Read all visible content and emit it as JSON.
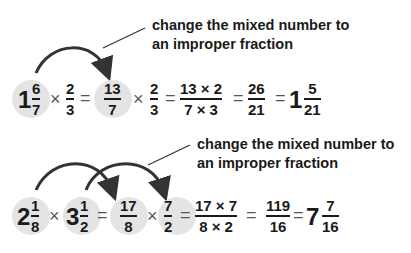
{
  "example1": {
    "note_line1": "change the mixed number to",
    "note_line2": "an improper fraction",
    "mixed": {
      "whole": "1",
      "num": "6",
      "den": "7"
    },
    "times": "×",
    "eq": "=",
    "f2": {
      "num": "2",
      "den": "3"
    },
    "improper": {
      "num": "13",
      "den": "7"
    },
    "f2b": {
      "num": "2",
      "den": "3"
    },
    "product": {
      "num": "13 × 2",
      "den": "7 × 3"
    },
    "result": {
      "num": "26",
      "den": "21"
    },
    "answer": {
      "whole": "1",
      "num": "5",
      "den": "21"
    }
  },
  "example2": {
    "note_line1": "change the mixed number to",
    "note_line2": "an improper fraction",
    "mixed1": {
      "whole": "2",
      "num": "1",
      "den": "8"
    },
    "mixed2": {
      "whole": "3",
      "num": "1",
      "den": "2"
    },
    "times": "×",
    "eq": "=",
    "improper1": {
      "num": "17",
      "den": "8"
    },
    "improper2": {
      "num": "7",
      "den": "2"
    },
    "product": {
      "num": "17 × 7",
      "den": "8 × 2"
    },
    "result": {
      "num": "119",
      "den": "16"
    },
    "answer": {
      "whole": "7",
      "num": "7",
      "den": "16"
    }
  },
  "colors": {
    "highlight_circle": "#e4e4e4",
    "text": "#1a1a1a",
    "arrow": "#333333"
  }
}
